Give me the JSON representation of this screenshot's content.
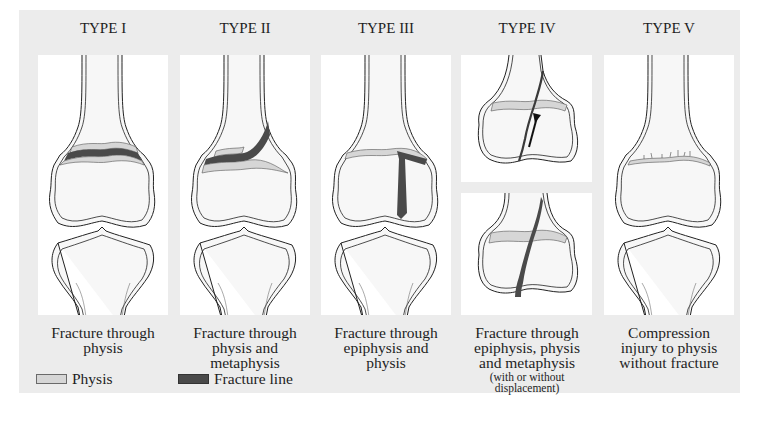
{
  "figure": {
    "types": [
      {
        "label": "TYPE I",
        "caption": [
          "Fracture through",
          "physis"
        ]
      },
      {
        "label": "TYPE II",
        "caption": [
          "Fracture through",
          "physis and",
          "metaphysis"
        ]
      },
      {
        "label": "TYPE III",
        "caption": [
          "Fracture through",
          "epiphysis and",
          "physis"
        ]
      },
      {
        "label": "TYPE IV",
        "caption": [
          "Fracture through",
          "epiphysis, physis",
          "and metaphysis"
        ],
        "subcaption": [
          "(with or without",
          "displacement)"
        ]
      },
      {
        "label": "TYPE V",
        "caption": [
          "Compression",
          "injury to physis",
          "without fracture"
        ]
      }
    ],
    "legend": [
      {
        "label": "Physis",
        "color": "#d6d6d6"
      },
      {
        "label": "Fracture line",
        "color": "#4a4a4a"
      }
    ]
  },
  "colors": {
    "background": "#ececec",
    "panel": "#ffffff",
    "physis": "#d6d6d6",
    "fracture": "#4a4a4a",
    "outline": "#222222"
  }
}
